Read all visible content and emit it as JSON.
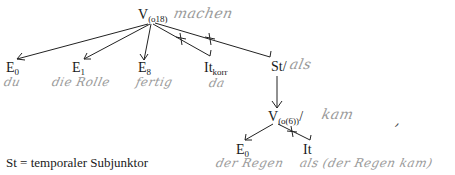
{
  "diagram": {
    "root": {
      "label": "V",
      "subscript": "(o18)",
      "annotation": "machen"
    },
    "children": [
      {
        "label": "E",
        "subscript": "0",
        "annotation": "du",
        "relation": "arrow"
      },
      {
        "label": "E",
        "subscript": "1",
        "annotation": "die Rolle",
        "relation": "arrow"
      },
      {
        "label": "E",
        "subscript": "8",
        "annotation": "fertig",
        "relation": "arrow"
      },
      {
        "label": "It",
        "subscript": "korr",
        "annotation": "da",
        "relation": "crossed-line"
      },
      {
        "label": "St/",
        "subscript": "",
        "annotation": "als",
        "relation": "crossed-line"
      }
    ],
    "sub_root": {
      "label": "V",
      "subscript": "(o(6))",
      "suffix": "/",
      "annotation": "kam"
    },
    "sub_children": [
      {
        "label": "E",
        "subscript": "0",
        "annotation": "der Regen",
        "relation": "arrow"
      },
      {
        "label": "It",
        "subscript": "",
        "annotation": "als (der Regen kam)",
        "relation": "crossed-line"
      }
    ],
    "punctuation": ","
  },
  "legend": {
    "text": "St = temporaler Subjunktor"
  }
}
